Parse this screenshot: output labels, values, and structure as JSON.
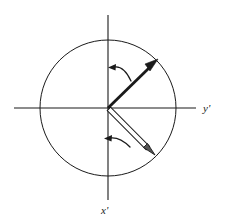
{
  "figure": {
    "title": "",
    "background_color": "#ffffff",
    "stroke_color": "#1a1a1a",
    "width": 227,
    "height": 222
  },
  "axes": {
    "origin": {
      "x": 108,
      "y": 108
    },
    "horizontal": {
      "label": "y'",
      "label_x": 205,
      "label_y": 112,
      "x_start": 14,
      "x_end": 196,
      "y": 108
    },
    "vertical": {
      "label": "x'",
      "label_x": 104,
      "label_y": 212,
      "y_start": 15,
      "y_end": 200,
      "x": 108
    }
  },
  "circle": {
    "name": "unit-circle",
    "center_x": 108,
    "center_y": 108,
    "radius": 68,
    "stroke_width": 1,
    "fill": "none"
  },
  "vectors": [
    {
      "name": "upper-vector",
      "style": "solid",
      "from_x": 108,
      "from_y": 108,
      "to_x": 155,
      "to_y": 62,
      "angle_deg": 44,
      "stroke_width": 2.6,
      "arrowhead": "filled"
    },
    {
      "name": "lower-vector",
      "style": "outlined",
      "from_x": 108,
      "from_y": 108,
      "to_x": 151,
      "to_y": 151,
      "angle_deg": -45,
      "stroke_width": 2.2,
      "arrowhead": "filled"
    }
  ],
  "rotation_arrows": [
    {
      "name": "upper-rotation-arrow",
      "direction": "counterclockwise",
      "path": "M 131 80 C 126 70 120 66 113 67",
      "tip_x": 113,
      "tip_y": 67
    },
    {
      "name": "lower-rotation-arrow",
      "direction": "counterclockwise",
      "path": "M 128 146 C 122 140 116 137 109 138",
      "tip_x": 109,
      "tip_y": 138
    }
  ]
}
